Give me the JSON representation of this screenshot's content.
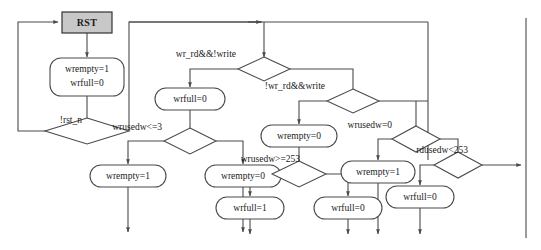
{
  "diagram": {
    "colors": {
      "stroke": "#4a4a4a",
      "node_fill": "#ffffff",
      "start_fill": "#c8c8c8",
      "text": "#1a1a1a",
      "background": "#ffffff"
    },
    "nodes": {
      "start": {
        "label": "RST",
        "shape": "rect"
      },
      "init": {
        "label_line1": "wrempty=1",
        "label_line2": "wrfull=0",
        "shape": "rounded"
      },
      "wrfull0_a": {
        "label": "wrfull=0",
        "shape": "rounded"
      },
      "wrempty1_a": {
        "label": "wrempty=1",
        "shape": "rounded"
      },
      "wrempty0_a": {
        "label": "wrempty=0",
        "shape": "rounded"
      },
      "wrempty0_b": {
        "label": "wrempty=0",
        "shape": "rounded"
      },
      "wrfull1": {
        "label": "wrfull=1",
        "shape": "rounded"
      },
      "wrfull0_b": {
        "label": "wrfull=0",
        "shape": "rounded"
      },
      "wrempty1_b": {
        "label": "wrempty=1",
        "shape": "rounded"
      },
      "wrfull0_c": {
        "label": "wrfull=0",
        "shape": "rounded"
      }
    },
    "decisions": {
      "rst_n": {
        "label": "!rst_n"
      },
      "wr_rd_not_write": {
        "label": "wr_rd&&!write"
      },
      "not_wr_rd_write": {
        "label": "!wr_rd&&write"
      },
      "wrusedw_le_3": {
        "label": "wrusedw<=3"
      },
      "wrusedw_ge_253": {
        "label": "wrusedw>=253"
      },
      "wrusedw_eq_0": {
        "label": "wrusedw=0"
      },
      "rdusedw_lt_253": {
        "label": "rdusedw<253"
      }
    }
  }
}
